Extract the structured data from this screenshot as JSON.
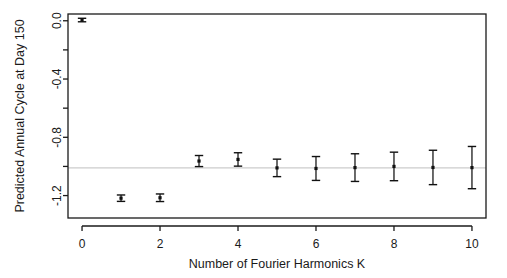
{
  "chart_data": {
    "type": "scatter",
    "title": "",
    "xlabel": "Number of Fourier Harmonics K",
    "ylabel": "Predicted Annual Cycle at Day 150",
    "xlim": [
      -0.36,
      10.36
    ],
    "ylim": [
      -1.354,
      0.0464
    ],
    "xticks": [
      0,
      2,
      4,
      6,
      8,
      10
    ],
    "xticklabels": [
      "0",
      "2",
      "4",
      "6",
      "8",
      "10"
    ],
    "yticks": [
      0.0,
      -0.2,
      -0.4,
      -0.6,
      -0.8,
      -1.0,
      -1.2
    ],
    "yticklabels": [
      "0.0",
      "",
      "-0.4",
      "",
      "-0.8",
      "",
      "-1.2"
    ],
    "ytick_labels_shown": [
      "0.0",
      "-0.4",
      "-0.8",
      "-1.2"
    ],
    "grid": false,
    "legend": "none",
    "reference_line": {
      "orientation": "horizontal",
      "y": -1.01,
      "color": "#cccccc",
      "style": "solid"
    },
    "marker": "filled-square",
    "error_bar_style": "capped",
    "x": [
      0,
      1,
      2,
      3,
      4,
      5,
      6,
      7,
      8,
      9,
      10
    ],
    "y": [
      0.005,
      -1.218,
      -1.215,
      -0.963,
      -0.952,
      -1.01,
      -1.014,
      -1.008,
      -1.0,
      -1.007,
      -1.008
    ],
    "yerr_lower": [
      0.012,
      0.022,
      0.026,
      0.038,
      0.046,
      0.06,
      0.082,
      0.095,
      0.098,
      0.118,
      0.145
    ],
    "yerr_upper": [
      0.012,
      0.022,
      0.026,
      0.038,
      0.046,
      0.06,
      0.082,
      0.095,
      0.098,
      0.118,
      0.145
    ],
    "series_name": "Predicted annual cycle",
    "points": [
      {
        "k": 0,
        "value": 0.005,
        "lower": -0.007,
        "upper": 0.017
      },
      {
        "k": 1,
        "value": -1.218,
        "lower": -1.24,
        "upper": -1.196
      },
      {
        "k": 2,
        "value": -1.215,
        "lower": -1.241,
        "upper": -1.189
      },
      {
        "k": 3,
        "value": -0.963,
        "lower": -1.001,
        "upper": -0.925
      },
      {
        "k": 4,
        "value": -0.952,
        "lower": -0.998,
        "upper": -0.906
      },
      {
        "k": 5,
        "value": -1.01,
        "lower": -1.07,
        "upper": -0.95
      },
      {
        "k": 6,
        "value": -1.014,
        "lower": -1.096,
        "upper": -0.932
      },
      {
        "k": 7,
        "value": -1.008,
        "lower": -1.103,
        "upper": -0.913
      },
      {
        "k": 8,
        "value": -1.0,
        "lower": -1.098,
        "upper": -0.902
      },
      {
        "k": 9,
        "value": -1.007,
        "lower": -1.125,
        "upper": -0.889
      },
      {
        "k": 10,
        "value": -1.008,
        "lower": -1.153,
        "upper": -0.863
      }
    ]
  },
  "colors": {
    "background": "#ffffff",
    "axis": "#1a1a1a",
    "marker": "#111111",
    "error_bar": "#111111",
    "reference_line": "#cccccc",
    "text": "#1a1a1a"
  }
}
